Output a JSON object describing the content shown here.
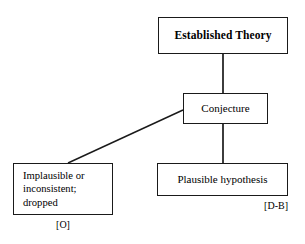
{
  "diagram": {
    "background_color": "#ffffff",
    "stroke_color": "#1a1a1a",
    "nodes": [
      {
        "id": "established-theory",
        "label": "Established Theory",
        "emphasis": "bold",
        "x": 158,
        "y": 17,
        "w": 130,
        "h": 37
      },
      {
        "id": "conjecture",
        "label": "Conjecture",
        "emphasis": "normal",
        "x": 183,
        "y": 93,
        "w": 85,
        "h": 31
      },
      {
        "id": "implausible",
        "label_line1": "Implausible or",
        "label_line2": "inconsistent;",
        "label_line3": "dropped",
        "emphasis": "normal",
        "x": 13,
        "y": 163,
        "w": 100,
        "h": 52
      },
      {
        "id": "plausible-hypothesis",
        "label": "Plausible hypothesis",
        "emphasis": "normal",
        "x": 157,
        "y": 163,
        "w": 131,
        "h": 33
      }
    ],
    "tags": [
      {
        "id": "tag-implausible",
        "label": "[O]"
      },
      {
        "id": "tag-plausible",
        "label": "[D-B]"
      }
    ],
    "edges": [
      {
        "id": "edge-theory-conjecture",
        "from": "established-theory",
        "to": "conjecture",
        "kind": "vertical"
      },
      {
        "id": "edge-conjecture-plausible",
        "from": "conjecture",
        "to": "plausible-hypothesis",
        "kind": "vertical"
      },
      {
        "id": "edge-conjecture-implausible",
        "from": "conjecture",
        "to": "implausible",
        "kind": "diagonal"
      }
    ]
  }
}
